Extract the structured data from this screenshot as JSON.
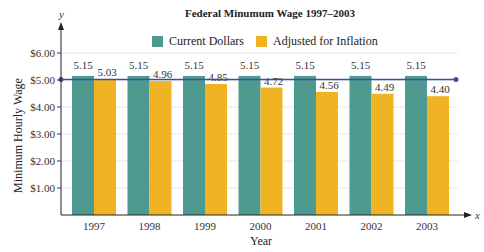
{
  "chart_data": {
    "type": "bar",
    "title": "Federal Minumum Wage 1997–2003",
    "xlabel": "Year",
    "ylabel": "Minimum Hourly Wage",
    "x_axis_symbol": "x",
    "y_axis_symbol": "y",
    "categories": [
      "1997",
      "1998",
      "1999",
      "2000",
      "2001",
      "2002",
      "2003"
    ],
    "series": [
      {
        "name": "Current Dollars",
        "color": "#4f9a90",
        "values": [
          5.15,
          5.15,
          5.15,
          5.15,
          5.15,
          5.15,
          5.15
        ]
      },
      {
        "name": "Adjusted for Inflation",
        "color": "#f0b323",
        "values": [
          5.03,
          4.96,
          4.85,
          4.72,
          4.56,
          4.49,
          4.4
        ]
      }
    ],
    "yticks": [
      "$1.00",
      "$2.00",
      "$3.00",
      "$4.00",
      "$5.00",
      "$6.00"
    ],
    "ylim": [
      0,
      6.5
    ],
    "reference_line": {
      "value": 5.15,
      "color": "#3a4fa0"
    },
    "grid": true,
    "legend_position": "top"
  }
}
